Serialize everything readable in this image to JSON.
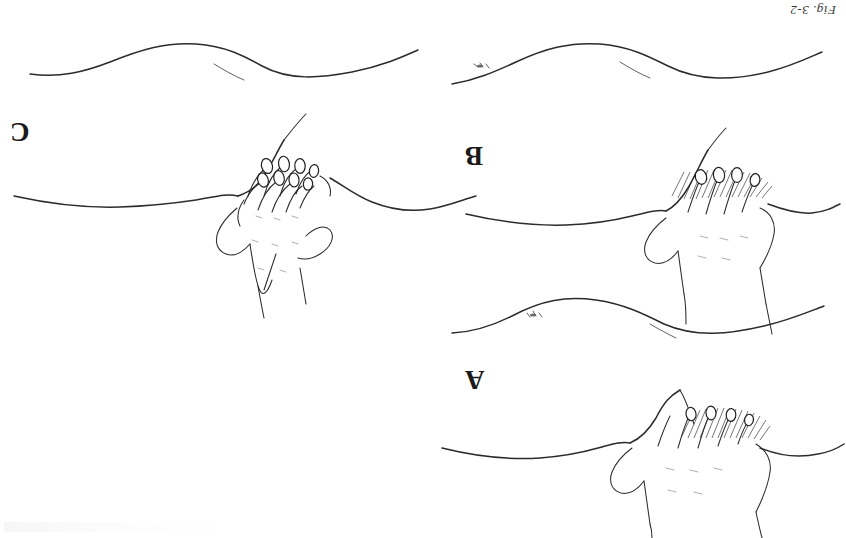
{
  "figure": {
    "caption": "Fig. 3-2",
    "orientation": "rotated-180",
    "background_color": "#ffffff",
    "ink_color": "#2b2b2b"
  },
  "panels": [
    {
      "id": "C",
      "label": "C",
      "position": "left-middle",
      "description": "Deep bimanual palpation: one hand placed over the other, both hands pressing into the abdominal wall, fingernails of both hands visible",
      "hands": 2,
      "hatching": false
    },
    {
      "id": "B",
      "label": "B",
      "position": "right-middle",
      "description": "Deeper palpation: single hand with fingers pressed into the abdominal wall, hatched shading above the fingertips indicating depression of the wall",
      "hands": 1,
      "hatching": true
    },
    {
      "id": "A",
      "label": "A",
      "position": "right-lower",
      "description": "Light palpation: single hand resting flat on the abdomen with fingers depressing the surface, hatched shading above the fingertips",
      "hands": 1,
      "hatching": true
    }
  ],
  "contours": [
    {
      "id": "contour-top-left",
      "position": "top-left",
      "description": "Abdominal profile in lateral view, relaxed",
      "navel_mark": false
    },
    {
      "id": "contour-top-right",
      "position": "top-right",
      "description": "Abdominal profile in lateral view with umbilicus mark",
      "navel_mark": true
    },
    {
      "id": "contour-middle-right",
      "position": "middle-right",
      "description": "Abdominal profile in lateral view with umbilicus mark",
      "navel_mark": true
    }
  ]
}
